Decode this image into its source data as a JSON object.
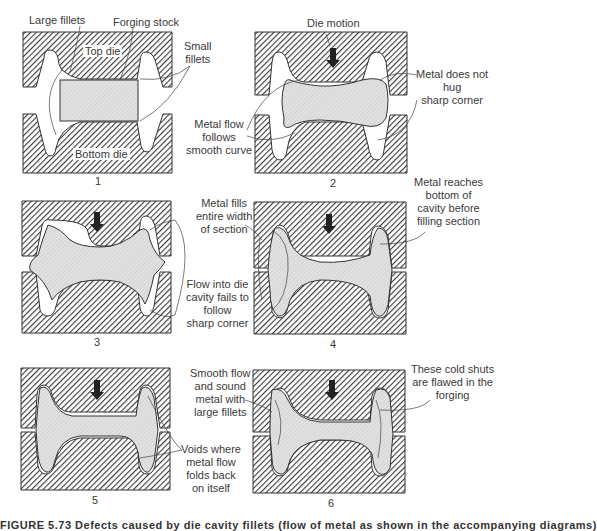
{
  "figure": {
    "caption_partial": "FIGURE 5.73  Defects caused by die cavity fillets (flow of metal as shown in the accompanying diagrams)",
    "panels": [
      {
        "number": "1",
        "inner_labels": {
          "top_die": "Top die",
          "bottom_die": "Bottom die"
        },
        "annotations": [
          {
            "id": "large-fillets",
            "text": "Large fillets"
          },
          {
            "id": "forging-stock",
            "text": "Forging stock"
          },
          {
            "id": "small-fillets",
            "text": "Small\nfillets"
          }
        ]
      },
      {
        "number": "2",
        "annotations": [
          {
            "id": "die-motion",
            "text": "Die motion"
          },
          {
            "id": "metal-not-hug",
            "text": "Metal does not\nhug\nsharp corner"
          },
          {
            "id": "metal-flow-smooth",
            "text": "Metal flow\nfollows\nsmooth curve"
          }
        ]
      },
      {
        "number": "3",
        "annotations": [
          {
            "id": "metal-fills-width",
            "text": "Metal fills\nentire width\nof section"
          },
          {
            "id": "flow-fails",
            "text": "Flow into die\ncavity fails to\nfollow\nsharp corner"
          }
        ]
      },
      {
        "number": "4",
        "annotations": [
          {
            "id": "metal-reaches-bottom",
            "text": "Metal reaches\nbottom of\ncavity before\nfilling section"
          }
        ]
      },
      {
        "number": "5",
        "annotations": [
          {
            "id": "voids",
            "text": "Voids where\nmetal flow\nfolds back\non itself"
          },
          {
            "id": "smooth-flow",
            "text": "Smooth flow\nand sound\nmetal with\nlarge fillets"
          }
        ]
      },
      {
        "number": "6",
        "annotations": [
          {
            "id": "cold-shuts",
            "text": "These cold shuts\nare flawed in the\nforging"
          }
        ]
      }
    ],
    "colors": {
      "die_hatch": "#3a3a3a",
      "metal_fill": "#d8d8d8",
      "background": "#ffffff",
      "text": "#3a3a3a"
    },
    "icons": {
      "die_motion": "down-arrow-icon"
    }
  }
}
